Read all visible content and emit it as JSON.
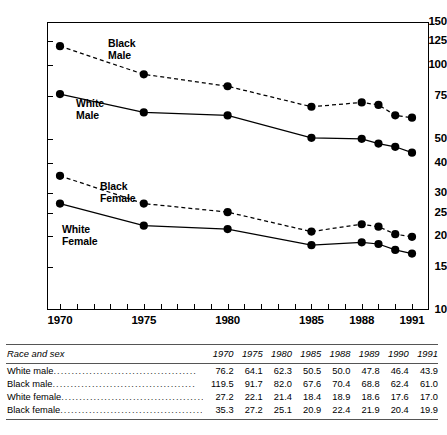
{
  "chart_data": {
    "type": "line",
    "title": "",
    "xlabel": "",
    "ylabel": "",
    "yscale": "log",
    "ylim": [
      10,
      150
    ],
    "xlim": [
      1970,
      1991
    ],
    "grid": false,
    "legend_position": "inline-annotations",
    "ytick_labels": [
      "150",
      "125",
      "100",
      "75",
      "50",
      "40",
      "30",
      "25",
      "20",
      "15",
      "10"
    ],
    "ytick_values": [
      150,
      125,
      100,
      75,
      50,
      40,
      30,
      25,
      20,
      15,
      10
    ],
    "xtick_labels": [
      "1970",
      "1975",
      "1980",
      "1985",
      "1988",
      "1991"
    ],
    "xtick_values": [
      1970,
      1975,
      1980,
      1985,
      1988,
      1991
    ],
    "x": [
      1970,
      1975,
      1980,
      1985,
      1988,
      1989,
      1990,
      1991
    ],
    "series": [
      {
        "name": "Black Male",
        "style": "dashed",
        "values": [
          119.5,
          91.7,
          82.0,
          67.6,
          70.4,
          68.8,
          62.4,
          61.0
        ]
      },
      {
        "name": "White Male",
        "style": "solid",
        "values": [
          76.2,
          64.1,
          62.3,
          50.5,
          50.0,
          47.8,
          46.4,
          43.9
        ]
      },
      {
        "name": "Black Female",
        "style": "dashed",
        "values": [
          35.3,
          27.2,
          25.1,
          20.9,
          22.4,
          21.9,
          20.4,
          19.9
        ]
      },
      {
        "name": "White Female",
        "style": "solid",
        "values": [
          27.2,
          22.1,
          21.4,
          18.4,
          18.9,
          18.6,
          17.6,
          17.0
        ]
      }
    ],
    "annotations": [
      {
        "text": "Black\nMale",
        "series": "Black Male"
      },
      {
        "text": "White\nMale",
        "series": "White Male"
      },
      {
        "text": "Black\nFemale",
        "series": "Black Female"
      },
      {
        "text": "White\nFemale",
        "series": "White Female"
      }
    ]
  },
  "annotation_labels": {
    "black_male": "Black\nMale",
    "white_male": "White\nMale",
    "black_female": "Black\nFemale",
    "white_female": "White\nFemale"
  },
  "table": {
    "columns": [
      "Race and sex",
      "1970",
      "1975",
      "1980",
      "1985",
      "1988",
      "1989",
      "1990",
      "1991"
    ],
    "rows": [
      {
        "label": "White male",
        "values": [
          "76.2",
          "64.1",
          "62.3",
          "50.5",
          "50.0",
          "47.8",
          "46.4",
          "43.9"
        ]
      },
      {
        "label": "Black male",
        "values": [
          "119.5",
          "91.7",
          "82.0",
          "67.6",
          "70.4",
          "68.8",
          "62.4",
          "61.0"
        ]
      },
      {
        "label": "White female",
        "values": [
          "27.2",
          "22.1",
          "21.4",
          "18.4",
          "18.9",
          "18.6",
          "17.6",
          "17.0"
        ]
      },
      {
        "label": "Black female",
        "values": [
          "35.3",
          "27.2",
          "25.1",
          "20.9",
          "22.4",
          "21.9",
          "20.4",
          "19.9"
        ]
      }
    ]
  },
  "colors": {
    "line": "#000000",
    "marker": "#000000",
    "axis": "#000000",
    "rule": "#555555"
  }
}
